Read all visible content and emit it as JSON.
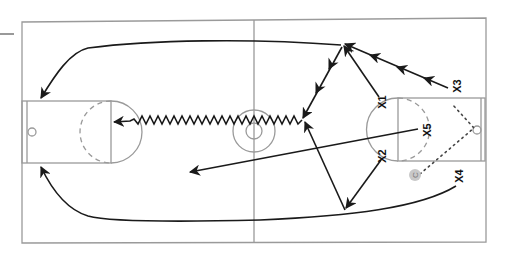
{
  "diagram": {
    "colors": {
      "court_lines": "#9a9a9a",
      "movement": "#1a1a1a",
      "coach_marker": "#c8c8c8"
    },
    "players": [
      {
        "id": "x1",
        "label": "X1"
      },
      {
        "id": "x2",
        "label": "X2"
      },
      {
        "id": "x3",
        "label": "X3"
      },
      {
        "id": "x4",
        "label": "X4"
      },
      {
        "id": "x5",
        "label": "X5"
      }
    ],
    "coach": {
      "label": "C"
    },
    "legend": {
      "cut": "solid arrow",
      "dribble": "zigzag arrow",
      "pass": "dotted line"
    }
  }
}
